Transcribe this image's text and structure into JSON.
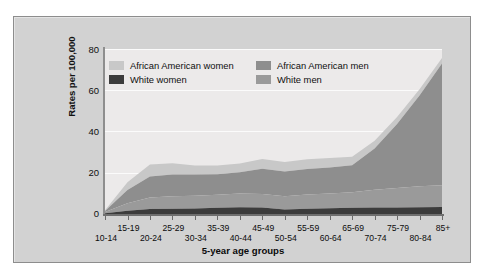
{
  "chart_data": {
    "type": "area",
    "stacked": true,
    "title": "",
    "subtitle": "",
    "xlabel": "5-year age groups",
    "ylabel": "Rates per 100,000",
    "categories": [
      "10-14",
      "15-19",
      "20-24",
      "25-29",
      "30-34",
      "35-39",
      "40-44",
      "45-49",
      "50-54",
      "55-59",
      "60-64",
      "65-69",
      "70-74",
      "75-79",
      "80-84",
      "85+"
    ],
    "xtick_labels": [
      "10-14",
      "15-19",
      "20-24",
      "25-29",
      "30-34",
      "35-39",
      "40-44",
      "45-49",
      "50-54",
      "55-59",
      "60-64",
      "65-69",
      "70-74",
      "75-79",
      "80-84",
      "85+"
    ],
    "ytick_labels": [
      "0",
      "20",
      "40",
      "60",
      "80"
    ],
    "ytick_values": [
      0,
      20,
      40,
      60,
      80
    ],
    "ylim": [
      0,
      80
    ],
    "grid": true,
    "grid_axis": "y",
    "legend_position": "top-inside",
    "series": [
      {
        "name": "White women",
        "color": "#3c3c3c",
        "stack_order": 1,
        "values": [
          0.4,
          1.6,
          2.4,
          2.6,
          2.7,
          3.0,
          3.3,
          3.1,
          2.2,
          2.6,
          2.8,
          3.0,
          3.1,
          3.2,
          3.3,
          3.4
        ]
      },
      {
        "name": "White men",
        "color": "#9a9a9a",
        "stack_order": 2,
        "values": [
          0.6,
          3.6,
          5.6,
          6.0,
          6.2,
          6.3,
          6.6,
          6.6,
          6.4,
          6.8,
          7.2,
          7.6,
          8.6,
          9.4,
          10.2,
          10.6
        ]
      },
      {
        "name": "African American men",
        "color": "#8e8e8e",
        "stack_order": 3,
        "values": [
          0.5,
          6.4,
          10.2,
          10.6,
          10.2,
          10.0,
          10.4,
          12.2,
          12.0,
          12.4,
          12.6,
          13.0,
          20.0,
          31.0,
          44.0,
          59.0
        ]
      },
      {
        "name": "African American women",
        "color": "#c8c8c8",
        "stack_order": 4,
        "values": [
          0.3,
          3.8,
          5.8,
          5.4,
          4.4,
          4.2,
          4.2,
          4.8,
          4.6,
          4.8,
          4.6,
          4.2,
          3.8,
          3.4,
          3.0,
          2.6
        ]
      }
    ],
    "stack_totals": [
      1.8,
      15.4,
      24.0,
      24.6,
      23.5,
      23.5,
      24.5,
      26.7,
      25.2,
      26.6,
      27.2,
      27.8,
      35.5,
      47.0,
      60.5,
      75.6
    ],
    "annotations": []
  },
  "legend": {
    "columns": [
      {
        "entries": [
          {
            "label": "African American women",
            "color": "#c8c8c8"
          },
          {
            "label": "White women",
            "color": "#3c3c3c"
          }
        ]
      },
      {
        "entries": [
          {
            "label": "African American men",
            "color": "#8e8e8e"
          },
          {
            "label": "White men",
            "color": "#9a9a9a"
          }
        ]
      }
    ]
  },
  "colors": {
    "figure_background": "#ffffff",
    "frame_background": "#d2d2d2",
    "plot_background": "#eceaea",
    "axis": "#6f6f6f",
    "gridline": "#fbfbfb",
    "text": "#0f0f0f"
  }
}
